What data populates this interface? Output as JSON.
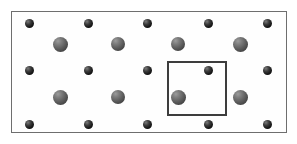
{
  "figure": {
    "kind": "crystal-lattice-unit-cell-diagram",
    "width": 297,
    "height": 144,
    "background_color": "#ffffff"
  },
  "crystal_frame": {
    "name": "crystal-boundary-rectangle",
    "x": 11,
    "y": 11,
    "width": 276,
    "height": 122,
    "fill_color": "#fefefe",
    "border_color": "#6e6e6e",
    "border_width": 1
  },
  "unit_cell": {
    "name": "unit-cell-square",
    "x": 167,
    "y": 61,
    "width": 60,
    "height": 55,
    "border_color": "#3d3d3d",
    "border_width": 2,
    "fill_color": "transparent"
  },
  "atom_types": [
    {
      "id": "small-dark-atom",
      "label": "small dark sphere",
      "diameter": 9,
      "color": "#161616",
      "highlight_color": "#7a7a7a"
    },
    {
      "id": "large-gray-atom",
      "label": "large gray sphere",
      "diameter": 15,
      "color": "#5c5c5c",
      "highlight_color": "#9c9c9c"
    }
  ],
  "lattice": {
    "small_atom_columns_x": [
      29,
      88,
      147,
      208,
      267
    ],
    "small_atom_rows_y": [
      23,
      70,
      124
    ],
    "large_atom_columns_x": [
      60,
      118,
      178,
      240
    ],
    "large_atom_rows_y": [
      44,
      97
    ],
    "column_spacing": 59,
    "row_spacing": 53
  },
  "atoms": [
    {
      "type": "small-dark-atom",
      "cx": 29,
      "cy": 23,
      "d": 9,
      "in_unit_cell": false
    },
    {
      "type": "small-dark-atom",
      "cx": 88,
      "cy": 23,
      "d": 9,
      "in_unit_cell": false
    },
    {
      "type": "small-dark-atom",
      "cx": 147,
      "cy": 23,
      "d": 9,
      "in_unit_cell": false
    },
    {
      "type": "small-dark-atom",
      "cx": 208,
      "cy": 23,
      "d": 9,
      "in_unit_cell": false
    },
    {
      "type": "small-dark-atom",
      "cx": 267,
      "cy": 23,
      "d": 9,
      "in_unit_cell": false
    },
    {
      "type": "large-gray-atom",
      "cx": 60,
      "cy": 44,
      "d": 15,
      "in_unit_cell": false
    },
    {
      "type": "large-gray-atom",
      "cx": 118,
      "cy": 44,
      "d": 14,
      "in_unit_cell": false
    },
    {
      "type": "large-gray-atom",
      "cx": 178,
      "cy": 44,
      "d": 14,
      "in_unit_cell": false
    },
    {
      "type": "large-gray-atom",
      "cx": 240,
      "cy": 44,
      "d": 15,
      "in_unit_cell": false
    },
    {
      "type": "small-dark-atom",
      "cx": 29,
      "cy": 70,
      "d": 9,
      "in_unit_cell": false
    },
    {
      "type": "small-dark-atom",
      "cx": 88,
      "cy": 70,
      "d": 9,
      "in_unit_cell": false
    },
    {
      "type": "small-dark-atom",
      "cx": 147,
      "cy": 70,
      "d": 9,
      "in_unit_cell": false
    },
    {
      "type": "small-dark-atom",
      "cx": 208,
      "cy": 70,
      "d": 9,
      "in_unit_cell": true
    },
    {
      "type": "small-dark-atom",
      "cx": 267,
      "cy": 70,
      "d": 9,
      "in_unit_cell": false
    },
    {
      "type": "large-gray-atom",
      "cx": 60,
      "cy": 97,
      "d": 15,
      "in_unit_cell": false
    },
    {
      "type": "large-gray-atom",
      "cx": 118,
      "cy": 97,
      "d": 14,
      "in_unit_cell": false
    },
    {
      "type": "large-gray-atom",
      "cx": 178,
      "cy": 97,
      "d": 15,
      "in_unit_cell": true
    },
    {
      "type": "large-gray-atom",
      "cx": 240,
      "cy": 97,
      "d": 15,
      "in_unit_cell": false
    },
    {
      "type": "small-dark-atom",
      "cx": 29,
      "cy": 124,
      "d": 9,
      "in_unit_cell": false
    },
    {
      "type": "small-dark-atom",
      "cx": 88,
      "cy": 124,
      "d": 9,
      "in_unit_cell": false
    },
    {
      "type": "small-dark-atom",
      "cx": 147,
      "cy": 124,
      "d": 9,
      "in_unit_cell": false
    },
    {
      "type": "small-dark-atom",
      "cx": 208,
      "cy": 124,
      "d": 9,
      "in_unit_cell": false
    },
    {
      "type": "small-dark-atom",
      "cx": 267,
      "cy": 124,
      "d": 9,
      "in_unit_cell": false
    }
  ]
}
